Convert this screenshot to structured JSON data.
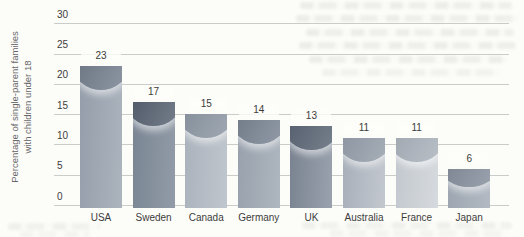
{
  "chart_data": {
    "type": "bar",
    "title": "",
    "categories": [
      "USA",
      "Sweden",
      "Canada",
      "Germany",
      "UK",
      "Australia",
      "France",
      "Japan"
    ],
    "values": [
      23,
      17,
      15,
      14,
      13,
      11,
      11,
      6
    ],
    "xlabel": "",
    "ylabel": "Percentage of single-parent families with children under 18",
    "ylabel_lines": [
      "Percentage of single-parent families",
      "with children under 18"
    ],
    "yticks": [
      0,
      5,
      10,
      15,
      20,
      25,
      30
    ],
    "ylim": [
      0,
      30
    ],
    "grid": "horizontal",
    "legend": "none",
    "bar_styles": [
      {
        "country": "USA",
        "body": "#949da9",
        "body_light": "#acb4be",
        "dome": "#6a7381",
        "dome_light": "#8b94a0"
      },
      {
        "country": "Sweden",
        "body": "#7a8593",
        "body_light": "#929ca8",
        "dome": "#4d5664",
        "dome_light": "#727c89"
      },
      {
        "country": "Canada",
        "body": "#aab2bc",
        "body_light": "#c0c6cd",
        "dome": "#828c98",
        "dome_light": "#9ea7b1"
      },
      {
        "country": "Germany",
        "body": "#98a1ac",
        "body_light": "#aeb6bf",
        "dome": "#6e7885",
        "dome_light": "#8f98a4"
      },
      {
        "country": "UK",
        "body": "#79828f",
        "body_light": "#99a2ad",
        "dome": "#535c6a",
        "dome_light": "#757f8c"
      },
      {
        "country": "Australia",
        "body": "#a7afb9",
        "body_light": "#c3c8cf",
        "dome": "#8a939e",
        "dome_light": "#a5adb7"
      },
      {
        "country": "France",
        "body": "#c2c8ce",
        "body_light": "#d6dade",
        "dome": "#9da5ae",
        "dome_light": "#b8bec6"
      },
      {
        "country": "Japan",
        "body": "#9ca5b0",
        "body_light": "#b3bac3",
        "dome": "#7b8490",
        "dome_light": "#98a1ac"
      }
    ]
  },
  "colors": {
    "background": "#fcfcf9",
    "gridline": "#c9ccc8",
    "label_text": "#3c3c3c",
    "axis_title_text": "#67676a"
  }
}
